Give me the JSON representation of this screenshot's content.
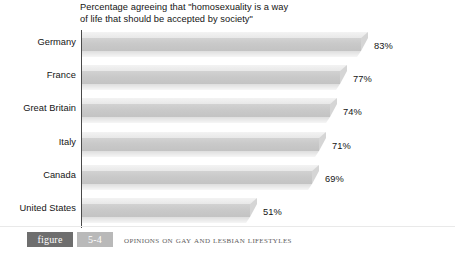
{
  "chart_data": {
    "type": "bar",
    "orientation": "horizontal",
    "title": "Percentage agreeing that \"homosexuality is a way\nof life that should be accepted by society\"",
    "xlabel": "",
    "ylabel": "",
    "xlim": [
      0,
      100
    ],
    "grid": false,
    "legend": null,
    "categories": [
      "Germany",
      "France",
      "Great Britain",
      "Italy",
      "Canada",
      "United States"
    ],
    "values": [
      83,
      77,
      74,
      71,
      69,
      51
    ],
    "value_labels": [
      "83%",
      "77%",
      "74%",
      "71%",
      "69%",
      "51%"
    ],
    "bar_style": "3d-beveled-gray",
    "colors": {
      "bar_top": "#e8e8e8",
      "bar_face": "#c9c9c9",
      "bar_bevel": "#dedede",
      "bar_shadow": "#b2b2b2",
      "axis": "#4a4a4a",
      "text": "#141414",
      "figure_word_bg": "#6e6e6e",
      "figure_num_bg": "#b9b9b9",
      "caption_text": "#5d5d5d",
      "background": "#ffffff"
    }
  },
  "figure": {
    "word": "figure",
    "number": "5-4",
    "caption": "Opinions on Gay and Lesbian Lifestyles"
  }
}
